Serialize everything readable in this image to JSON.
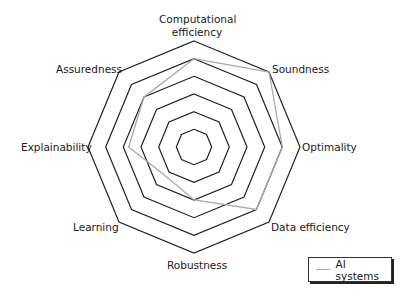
{
  "chart_data": {
    "type": "radar",
    "title": "",
    "categories": [
      "Computational efficiency",
      "Soundness",
      "Optimality",
      "Data efficiency",
      "Robustness",
      "Learning",
      "Explainability",
      "Assuredness"
    ],
    "rings": 6,
    "rmax": 6,
    "grid": true,
    "series": [
      {
        "name": "AI systems",
        "color": "#aaaaaa",
        "values": [
          5,
          6,
          5,
          5,
          3,
          2.3,
          3.7,
          4
        ]
      }
    ],
    "legend_position": "bottom-right"
  },
  "labels": {
    "computational_line1": "Computational",
    "computational_line2": "efficiency",
    "soundness": "Soundness",
    "optimality": "Optimality",
    "data_efficiency": "Data efficiency",
    "robustness": "Robustness",
    "learning": "Learning",
    "explainability": "Explainability",
    "assuredness": "Assuredness"
  },
  "legend": {
    "label": "AI systems"
  }
}
